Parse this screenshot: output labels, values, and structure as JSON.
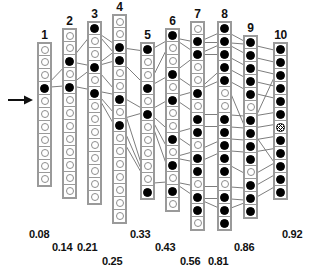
{
  "figure": {
    "type": "trellis-lattice-diagram",
    "width": 322,
    "height": 278,
    "background": "#ffffff",
    "node_on_color": "#000000",
    "node_off_color": "#ffffff",
    "cell_border_color": "#9a9a9a",
    "link_color": "#6e6e6e",
    "entry_marker": "left-arrow"
  },
  "columns": [
    {
      "id": 1,
      "header": "1",
      "value_label": "0.08",
      "x": 37,
      "top": 44,
      "label_x": 29,
      "label_y": 228,
      "cells": 11,
      "filled": [
        4
      ],
      "marked": []
    },
    {
      "id": 2,
      "header": "2",
      "value_label": "0.14",
      "x": 62,
      "top": 30,
      "label_x": 52,
      "label_y": 241,
      "cells": 13,
      "filled": [
        3,
        5
      ],
      "marked": []
    },
    {
      "id": 3,
      "header": "3",
      "value_label": "0.21",
      "x": 87,
      "top": 23,
      "label_x": 77,
      "label_y": 241,
      "cells": 14,
      "filled": [
        1,
        4,
        6
      ],
      "marked": []
    },
    {
      "id": 4,
      "header": "4",
      "value_label": "0.25",
      "x": 112,
      "top": 16,
      "label_x": 102,
      "label_y": 255,
      "cells": 16,
      "filled": [
        3,
        4,
        7,
        9
      ],
      "marked": []
    },
    {
      "id": 5,
      "header": "5",
      "value_label": "0.33",
      "x": 140,
      "top": 44,
      "label_x": 130,
      "label_y": 228,
      "cells": 12,
      "filled": [
        1,
        4,
        6,
        12
      ],
      "marked": []
    },
    {
      "id": 6,
      "header": "6",
      "value_label": "0.43",
      "x": 165,
      "top": 30,
      "label_x": 155,
      "label_y": 241,
      "cells": 14,
      "filled": [
        1,
        4,
        6,
        9,
        11,
        13
      ],
      "marked": []
    },
    {
      "id": 7,
      "header": "7",
      "value_label": "0.56",
      "x": 190,
      "top": 23,
      "label_x": 180,
      "label_y": 255,
      "cells": 16,
      "filled": [
        2,
        3,
        6,
        8,
        9,
        11,
        12,
        14,
        15
      ],
      "marked": []
    },
    {
      "id": 8,
      "header": "8",
      "value_label": "0.81",
      "x": 217,
      "top": 23,
      "label_x": 208,
      "label_y": 255,
      "cells": 16,
      "filled": [
        1,
        2,
        3,
        4,
        5,
        8,
        9,
        10,
        11,
        12,
        14,
        15,
        16
      ],
      "marked": []
    },
    {
      "id": 9,
      "header": "9",
      "value_label": "0.86",
      "x": 243,
      "top": 37,
      "label_x": 234,
      "label_y": 241,
      "cells": 14,
      "filled": [
        1,
        2,
        3,
        4,
        5,
        7,
        8,
        9,
        10,
        12,
        13,
        14
      ],
      "marked": []
    },
    {
      "id": 10,
      "header": "10",
      "value_label": "0.92",
      "x": 273,
      "top": 44,
      "label_x": 282,
      "label_y": 228,
      "cells": 12,
      "filled": [
        1,
        2,
        3,
        4,
        5,
        6,
        8,
        9,
        10,
        11,
        12
      ],
      "marked": [
        7
      ]
    }
  ],
  "links": [
    [
      1,
      4,
      2,
      3
    ],
    [
      1,
      4,
      2,
      5
    ],
    [
      2,
      3,
      3,
      1
    ],
    [
      2,
      3,
      3,
      4
    ],
    [
      2,
      5,
      3,
      4
    ],
    [
      2,
      5,
      3,
      6
    ],
    [
      3,
      1,
      4,
      3
    ],
    [
      3,
      1,
      4,
      4
    ],
    [
      3,
      4,
      4,
      3
    ],
    [
      3,
      4,
      4,
      4
    ],
    [
      3,
      4,
      4,
      7
    ],
    [
      3,
      6,
      4,
      7
    ],
    [
      3,
      6,
      4,
      9
    ],
    [
      3,
      6,
      5,
      12
    ],
    [
      4,
      3,
      5,
      1
    ],
    [
      4,
      4,
      5,
      4
    ],
    [
      4,
      7,
      5,
      6
    ],
    [
      4,
      9,
      5,
      6
    ],
    [
      4,
      9,
      5,
      12
    ],
    [
      4,
      7,
      5,
      12
    ],
    [
      5,
      1,
      6,
      1
    ],
    [
      5,
      4,
      6,
      1
    ],
    [
      5,
      4,
      6,
      4
    ],
    [
      5,
      6,
      6,
      6
    ],
    [
      5,
      6,
      6,
      9
    ],
    [
      5,
      6,
      6,
      11
    ],
    [
      5,
      6,
      6,
      13
    ],
    [
      5,
      12,
      6,
      13
    ],
    [
      6,
      1,
      7,
      2
    ],
    [
      6,
      1,
      7,
      3
    ],
    [
      6,
      4,
      7,
      3
    ],
    [
      6,
      4,
      7,
      6
    ],
    [
      6,
      6,
      7,
      6
    ],
    [
      6,
      6,
      7,
      8
    ],
    [
      6,
      9,
      7,
      9
    ],
    [
      6,
      9,
      7,
      11
    ],
    [
      6,
      11,
      7,
      11
    ],
    [
      6,
      11,
      7,
      12
    ],
    [
      6,
      13,
      7,
      14
    ],
    [
      6,
      13,
      7,
      15
    ],
    [
      7,
      2,
      8,
      1
    ],
    [
      7,
      2,
      8,
      2
    ],
    [
      7,
      3,
      8,
      2
    ],
    [
      7,
      3,
      8,
      3
    ],
    [
      7,
      6,
      8,
      4
    ],
    [
      7,
      6,
      8,
      5
    ],
    [
      7,
      8,
      8,
      8
    ],
    [
      7,
      9,
      8,
      9
    ],
    [
      7,
      11,
      8,
      10
    ],
    [
      7,
      12,
      8,
      11
    ],
    [
      7,
      14,
      8,
      14
    ],
    [
      7,
      15,
      8,
      15
    ],
    [
      7,
      15,
      8,
      16
    ],
    [
      8,
      1,
      9,
      1
    ],
    [
      8,
      2,
      9,
      1
    ],
    [
      8,
      2,
      9,
      2
    ],
    [
      8,
      3,
      9,
      3
    ],
    [
      8,
      4,
      9,
      4
    ],
    [
      8,
      5,
      9,
      5
    ],
    [
      8,
      5,
      9,
      9
    ],
    [
      8,
      8,
      9,
      7
    ],
    [
      8,
      9,
      9,
      8
    ],
    [
      8,
      10,
      9,
      9
    ],
    [
      8,
      11,
      9,
      10
    ],
    [
      8,
      12,
      9,
      12
    ],
    [
      8,
      14,
      9,
      13
    ],
    [
      8,
      15,
      9,
      14
    ],
    [
      8,
      16,
      9,
      14
    ],
    [
      9,
      1,
      10,
      1
    ],
    [
      9,
      2,
      10,
      2
    ],
    [
      9,
      3,
      10,
      3
    ],
    [
      9,
      4,
      10,
      4
    ],
    [
      9,
      5,
      10,
      5
    ],
    [
      9,
      7,
      10,
      6
    ],
    [
      9,
      8,
      10,
      7
    ],
    [
      9,
      9,
      10,
      8
    ],
    [
      9,
      10,
      10,
      9
    ],
    [
      9,
      12,
      10,
      10
    ],
    [
      9,
      13,
      10,
      11
    ],
    [
      9,
      14,
      10,
      12
    ],
    [
      9,
      8,
      10,
      2
    ],
    [
      9,
      8,
      10,
      11
    ]
  ]
}
